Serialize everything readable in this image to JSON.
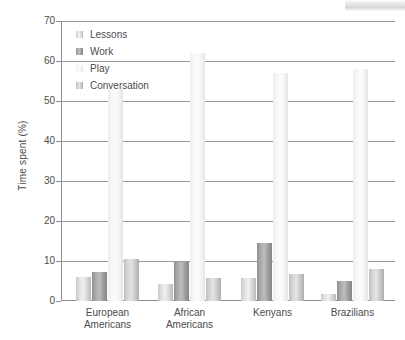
{
  "chart_data": {
    "type": "bar",
    "title": "",
    "subtitle": "",
    "xlabel": "",
    "ylabel": "Time spent (%)",
    "ylim": [
      0,
      70
    ],
    "ytick_step": 10,
    "yticks": [
      "0",
      "10",
      "20",
      "30",
      "40",
      "50",
      "60",
      "70"
    ],
    "grid": true,
    "legend_position": "top-left",
    "categories": [
      "European Americans",
      "African Americans",
      "Kenyans",
      "Brazilians"
    ],
    "category_lines": [
      [
        "European",
        "Americans"
      ],
      [
        "African",
        "Americans"
      ],
      [
        "Kenyans",
        ""
      ],
      [
        "Brazilians",
        ""
      ]
    ],
    "series": [
      {
        "name": "Lessons",
        "color": "#e0e0e0",
        "values": [
          6.0,
          4.3,
          5.8,
          1.8
        ]
      },
      {
        "name": "Work",
        "color": "#a8a8a8",
        "values": [
          7.3,
          9.8,
          14.5,
          5.1
        ]
      },
      {
        "name": "Play",
        "color": "#f7f7f7",
        "values": [
          53.0,
          62.0,
          57.0,
          58.0
        ]
      },
      {
        "name": "Conversation",
        "color": "#cccccc",
        "values": [
          10.5,
          5.8,
          6.8,
          8.0
        ]
      }
    ]
  },
  "legend": {
    "items": [
      {
        "label": "Lessons"
      },
      {
        "label": "Work"
      },
      {
        "label": "Play"
      },
      {
        "label": "Conversation"
      }
    ]
  },
  "colors": {
    "axis": "#8c8c8c",
    "grid": "#9a9a9a",
    "text": "#4c4c4c",
    "background": "#ffffff"
  }
}
